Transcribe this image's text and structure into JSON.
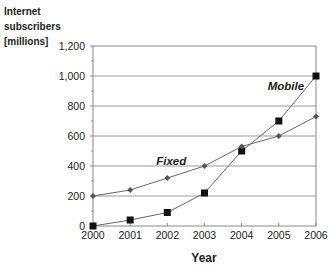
{
  "chart_data": {
    "type": "line",
    "title": "",
    "ylabel": [
      "Internet",
      "subscribers",
      "[millions]"
    ],
    "xlabel": "Year",
    "x": [
      2000,
      2001,
      2002,
      2003,
      2004,
      2005,
      2006
    ],
    "x_tick_labels": [
      "2000",
      "2001",
      "2002",
      "2003",
      "2004",
      "2005",
      "2006"
    ],
    "ylim": [
      0,
      1200
    ],
    "y_ticks": [
      0,
      200,
      400,
      600,
      800,
      1000,
      1200
    ],
    "y_tick_labels": [
      "0",
      "200",
      "400",
      "600",
      "800",
      "1,000",
      "1,200"
    ],
    "grid": "horizontal",
    "legend": "inline-labels",
    "series": [
      {
        "name": "Mobile",
        "marker": "square",
        "values": [
          0,
          40,
          90,
          220,
          500,
          700,
          1000
        ],
        "label_at": [
          2004.7,
          910
        ]
      },
      {
        "name": "Fixed",
        "marker": "diamond",
        "values": [
          200,
          240,
          320,
          400,
          530,
          600,
          730
        ],
        "label_at": [
          2001.7,
          410
        ]
      }
    ],
    "colors": {
      "line": "#666666",
      "grid": "#9a9a9a",
      "marker_mobile": "#111111",
      "marker_fixed": "#555555",
      "axis": "#888888"
    }
  }
}
